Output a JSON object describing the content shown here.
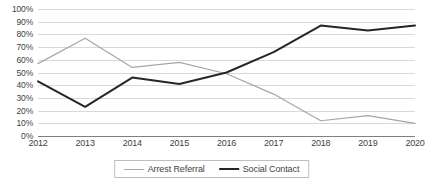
{
  "chart_data": {
    "type": "line",
    "title": "",
    "xlabel": "",
    "ylabel": "",
    "categories": [
      "2012",
      "2013",
      "2014",
      "2015",
      "2016",
      "2017",
      "2018",
      "2019",
      "2020"
    ],
    "ylim": [
      0,
      100
    ],
    "yticks": [
      0,
      10,
      20,
      30,
      40,
      50,
      60,
      70,
      80,
      90,
      100
    ],
    "ytick_labels": [
      "0%",
      "10%",
      "20%",
      "30%",
      "40%",
      "50%",
      "60%",
      "70%",
      "80%",
      "90%",
      "100%"
    ],
    "grid": "horizontal",
    "legend_position": "bottom-center",
    "series": [
      {
        "name": "Arrest Referral",
        "color": "#a6a6a6",
        "line_width": 1.2,
        "values": [
          57,
          77,
          54,
          58,
          49,
          33,
          12,
          16,
          10
        ]
      },
      {
        "name": "Social Contact",
        "color": "#262626",
        "line_width": 2.0,
        "values": [
          43,
          23,
          46,
          41,
          50,
          66,
          87,
          83,
          87
        ]
      }
    ]
  },
  "legend": {
    "items": [
      {
        "label": "Arrest Referral"
      },
      {
        "label": "Social Contact"
      }
    ]
  },
  "colors": {
    "gridline": "#d9d9d9",
    "axis": "#808080",
    "text": "#3f3f3f",
    "series_light": "#a6a6a6",
    "series_dark": "#262626",
    "background": "#ffffff"
  }
}
